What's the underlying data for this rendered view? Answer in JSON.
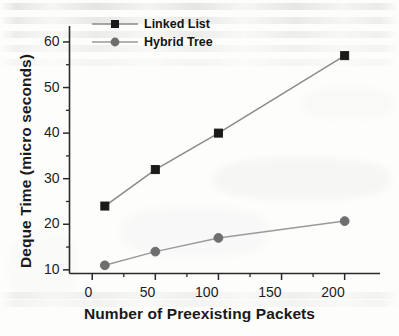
{
  "figure": {
    "background_color": "#fdfdfc",
    "ink_color": "#1a1a1a"
  },
  "chart_data": {
    "type": "line",
    "title": "",
    "xlabel": "Number of Preexisting Packets",
    "ylabel": "Deque Time (micro seconds)",
    "x": [
      10,
      50,
      100,
      200
    ],
    "xlim": [
      -18,
      228
    ],
    "ylim": [
      9.2,
      63.5
    ],
    "xticks": [
      0,
      50,
      100,
      150,
      200
    ],
    "xtick_labels": [
      "0",
      "50",
      "100",
      "150",
      "200"
    ],
    "xminor_ticks": [
      25,
      75,
      125,
      175
    ],
    "yticks": [
      10,
      20,
      30,
      40,
      50,
      60
    ],
    "ytick_labels": [
      "10",
      "20",
      "30",
      "40",
      "50",
      "60"
    ],
    "yminor_ticks": [
      15,
      25,
      35,
      45,
      55
    ],
    "grid": false,
    "legend_position": "top-left",
    "series": [
      {
        "name": "Linked List",
        "marker": "square",
        "color": "#1a1a1a",
        "line_color": "#8a8a8a",
        "values": [
          24,
          32,
          40,
          57
        ]
      },
      {
        "name": "Hybrid Tree",
        "marker": "circle",
        "color": "#6e6e6e",
        "line_color": "#9a9a9a",
        "values": [
          11,
          14,
          17,
          20.7
        ]
      }
    ]
  }
}
